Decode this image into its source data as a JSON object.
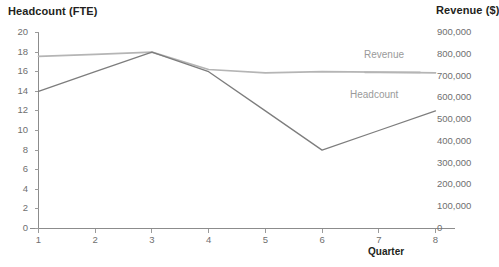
{
  "chart_data": {
    "type": "line",
    "title": "",
    "xlabel": "Quarter",
    "x": [
      1,
      2,
      3,
      4,
      5,
      6,
      7,
      8
    ],
    "categories": [
      "1",
      "2",
      "3",
      "4",
      "5",
      "6",
      "7",
      "8"
    ],
    "grid": false,
    "legend_position": "inline-right",
    "axes": {
      "left": {
        "label": "Headcount (FTE)",
        "ylim": [
          0,
          20
        ],
        "tick_step": 2,
        "ticks": [
          20,
          18,
          16,
          14,
          12,
          10,
          8,
          6,
          4,
          2,
          0
        ],
        "tick_labels": [
          "20",
          "18",
          "16",
          "14",
          "12",
          "10",
          "8",
          "6",
          "4",
          "2",
          "0"
        ]
      },
      "right": {
        "label": "Revenue ($)",
        "ylim": [
          0,
          900000
        ],
        "tick_step": 100000,
        "ticks": [
          900000,
          800000,
          700000,
          600000,
          500000,
          400000,
          300000,
          200000,
          100000,
          0
        ],
        "tick_labels": [
          "900,000",
          "800,000",
          "700,000",
          "600,000",
          "500,000",
          "400,000",
          "300,000",
          "200,000",
          "100,000",
          "0"
        ]
      },
      "x": {
        "label": "Quarter",
        "xlim": [
          1,
          8
        ],
        "ticks": [
          1,
          2,
          3,
          4,
          5,
          6,
          7,
          8
        ],
        "tick_labels": [
          "1",
          "2",
          "3",
          "4",
          "5",
          "6",
          "7",
          "8"
        ]
      }
    },
    "series": [
      {
        "name": "Revenue",
        "label": "Revenue",
        "axis": "right",
        "color": "#b5b5b5",
        "unit": "$",
        "values": [
          790000,
          800000,
          810000,
          730000,
          715000,
          720000,
          718000,
          715000
        ]
      },
      {
        "name": "Headcount",
        "label": "Headcount",
        "axis": "left",
        "color": "#7d7d7d",
        "unit": "FTE",
        "values": [
          14,
          16,
          18,
          16,
          12,
          8,
          10,
          12
        ]
      }
    ]
  },
  "labels": {
    "left_axis_title": "Headcount (FTE)",
    "right_axis_title": "Revenue ($)",
    "x_axis_title": "Quarter",
    "series_revenue": "Revenue",
    "series_headcount": "Headcount"
  },
  "colors": {
    "revenue_line": "#b5b5b5",
    "headcount_line": "#7d7d7d",
    "axis": "#8c8c8c",
    "tick_text": "#6f6f6f",
    "title_text": "#231f20",
    "series_label_text": "#9a9a9a",
    "background": "#ffffff"
  }
}
